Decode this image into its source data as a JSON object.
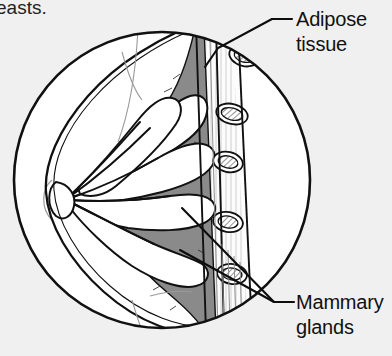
{
  "figure": {
    "style": "black-and-white line drawing, circular inset",
    "partial_caption_top_left": "easts."
  },
  "colors": {
    "background": "#f0f0f0",
    "ink": "#111111",
    "adipose_fill": "#8a8a8a",
    "gland_fill": "#ffffff",
    "skin_fill": "#ffffff",
    "rib_fill": "#ffffff",
    "muscle_fill": "#fbfbfb"
  },
  "labels": [
    {
      "id": "adipose-tissue",
      "line1": "Adipose",
      "line2": "tissue",
      "text_x": 296,
      "text_y": 26,
      "dash_x1": 272,
      "dash_x2": 292,
      "dash_y": 19,
      "leader_points": "272,19 218,48 205,67"
    },
    {
      "id": "mammary-glands",
      "line1": "Mammary",
      "line2": "glands",
      "text_x": 296,
      "text_y": 308,
      "dash_x1": 274,
      "dash_x2": 294,
      "dash_y": 302,
      "leader_points_upper": "274,302 182,208",
      "leader_points_lower": "274,302 180,250"
    }
  ],
  "structures": [
    {
      "name": "skin",
      "description": "outer body contour of the breast"
    },
    {
      "name": "nipple",
      "description": "apex at left where lactiferous ducts converge"
    },
    {
      "name": "lactiferous-ducts",
      "description": "branching ducts radiating from nipple"
    },
    {
      "name": "mammary-glands",
      "description": "white lobular gland clusters"
    },
    {
      "name": "adipose-tissue",
      "description": "gray fatty tissue surrounding glands"
    },
    {
      "name": "pectoral-muscle",
      "description": "light band along chest wall"
    },
    {
      "name": "ribs",
      "description": "oval cross-sections with hatched interiors",
      "count": 5
    }
  ]
}
